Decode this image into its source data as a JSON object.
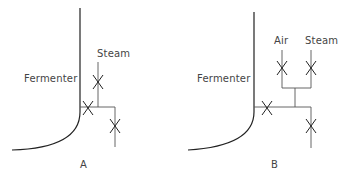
{
  "figure": {
    "panels": [
      {
        "id": "A",
        "caption": "A",
        "vessel_label": "Fermenter",
        "inlet_labels": [
          "Steam"
        ],
        "valve_count": 3
      },
      {
        "id": "B",
        "caption": "B",
        "vessel_label": "Fermenter",
        "inlet_labels": [
          "Air",
          "Steam"
        ],
        "valve_count": 4
      }
    ]
  }
}
